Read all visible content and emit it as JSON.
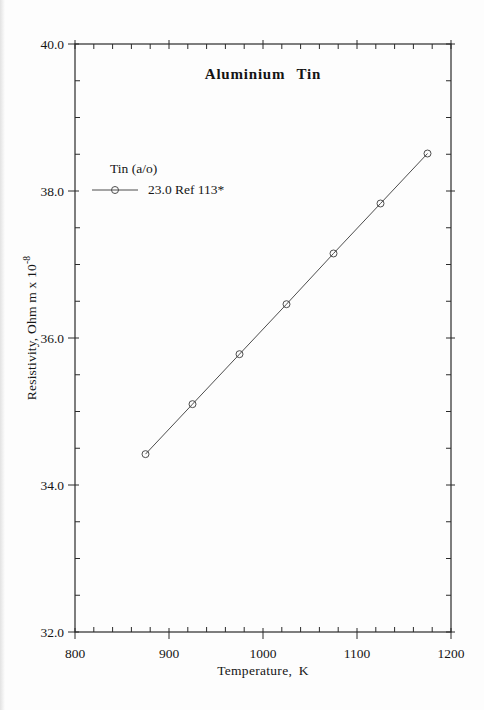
{
  "page": {
    "background": "#fdfdfd"
  },
  "chart_data": {
    "type": "line",
    "title": "Aluminium Tin",
    "xlabel": "Temperature, K",
    "ylabel": "Resistivity, Ohm m x 10",
    "ylabel_exponent": "-8",
    "xlim": [
      800,
      1200
    ],
    "ylim": [
      32.0,
      40.0
    ],
    "x_major_ticks": [
      800,
      900,
      1000,
      1100,
      1200
    ],
    "x_tick_labels": [
      "800",
      "900",
      "1000",
      "1100",
      "1200"
    ],
    "x_minor_step": 20,
    "y_major_ticks": [
      32.0,
      34.0,
      36.0,
      38.0,
      40.0
    ],
    "y_tick_labels": [
      "32.0",
      "34.0",
      "36.0",
      "38.0",
      "40.0"
    ],
    "y_minor_step": 0.5,
    "grid": false,
    "legend_position": "upper-left-inside",
    "legend": {
      "header": "Tin (a/o)",
      "entries": [
        {
          "label": "23.0 Ref 113*",
          "marker": "open-circle"
        }
      ]
    },
    "series": [
      {
        "name": "23.0 Ref 113*",
        "marker": "open-circle",
        "x": [
          875,
          925,
          975,
          1025,
          1075,
          1125,
          1175
        ],
        "y": [
          34.42,
          35.1,
          35.78,
          36.46,
          37.15,
          37.83,
          38.51
        ]
      }
    ],
    "colors": {
      "axis": "#2b2b2b",
      "text": "#161616",
      "series": "#4d4d4d",
      "background": "#fdfdfd"
    }
  }
}
